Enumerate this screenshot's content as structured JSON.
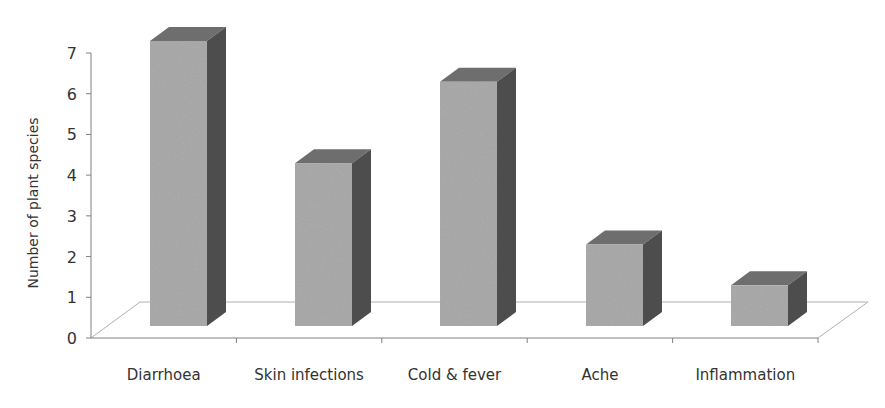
{
  "chart_data": {
    "type": "bar",
    "style": "3d-column",
    "title": "",
    "xlabel": "",
    "ylabel": "Number of plant species",
    "categories": [
      "Diarrhoea",
      "Skin infections",
      "Cold & fever",
      "Ache",
      "Inflammation"
    ],
    "values": [
      7,
      4,
      6,
      2,
      1
    ],
    "ylim": [
      0,
      7
    ],
    "yticks": [
      "0",
      "1",
      "2",
      "3",
      "4",
      "5",
      "6",
      "7"
    ],
    "grid": false,
    "legend": null,
    "colors": {
      "bar_front": "#a6a6a6",
      "bar_side": "#4d4d4d",
      "bar_top": "#6e6e6e",
      "axis": "#808080",
      "floor_line": "#b0b0b0",
      "text": "#333333"
    }
  }
}
